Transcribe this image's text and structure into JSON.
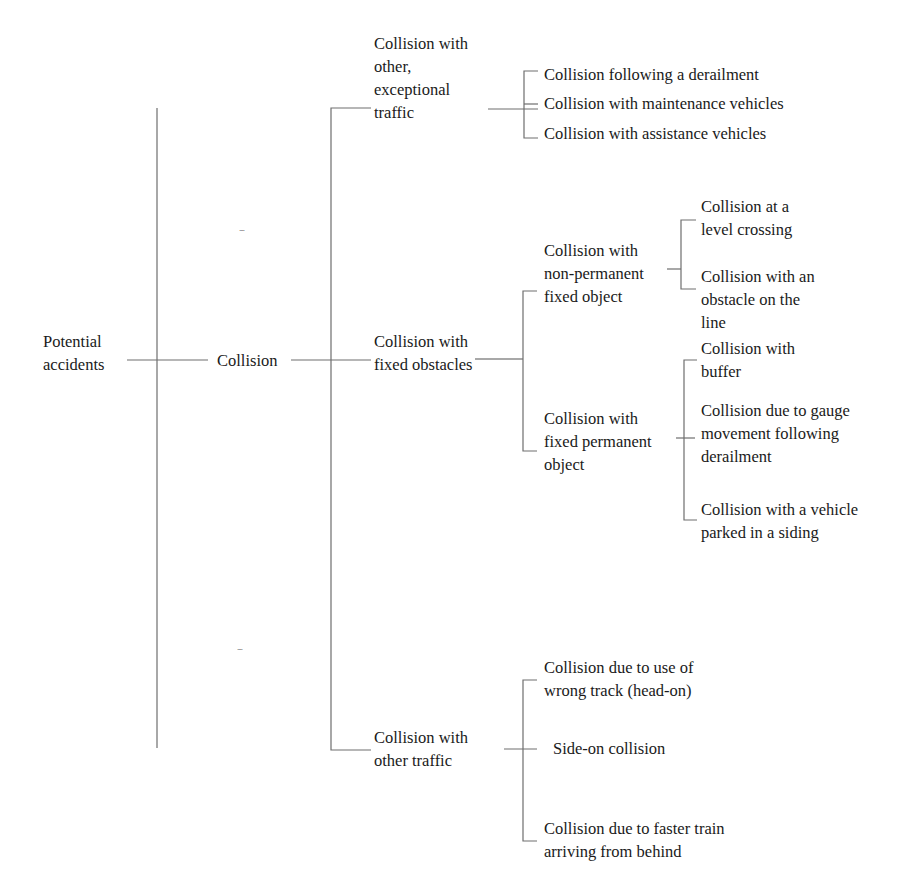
{
  "diagram": {
    "type": "tree",
    "root": "Potential accidents",
    "level1": {
      "label": "Collision",
      "siblings_placeholder_top": "....",
      "siblings_placeholder_bottom": "...."
    },
    "level2": [
      {
        "label": "Collision with\nother,\nexceptional\ntraffic",
        "children": [
          "Collision following a derailment",
          "Collision with maintenance vehicles",
          "Collision with assistance vehicles"
        ]
      },
      {
        "label": "Collision with\nfixed obstacles",
        "children": [
          {
            "label": "Collision with\nnon-permanent\nfixed object",
            "children": [
              "Collision at a\nlevel crossing",
              "Collision with an\nobstacle on the\nline"
            ]
          },
          {
            "label": "Collision with\nfixed permanent\nobject",
            "children": [
              "Collision with\nbuffer",
              "Collision due to gauge\nmovement following\nderailment",
              "Collision with a vehicle\nparked in a siding"
            ]
          }
        ]
      },
      {
        "label": "Collision with\nother traffic",
        "children": [
          "Collision due to use of\nwrong track (head-on)",
          "Side-on collision",
          "Collision due to faster train\narriving from behind"
        ]
      }
    ]
  },
  "colors": {
    "line": "#6e6e6e",
    "text": "#1a1a1a",
    "background": "#ffffff"
  }
}
